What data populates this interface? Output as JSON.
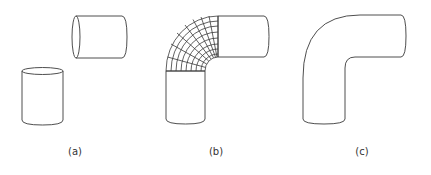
{
  "figure": {
    "panels": [
      {
        "id": "a",
        "label": "(a)",
        "description": "two separate cylinders, one horizontal, one vertical"
      },
      {
        "id": "b",
        "label": "(b)",
        "description": "cylinders joined by a curved elbow patch shown as a mesh grid"
      },
      {
        "id": "c",
        "label": "(c)",
        "description": "final smooth blended elbow pipe outline"
      }
    ],
    "stroke_color": "#3a3a3a"
  }
}
